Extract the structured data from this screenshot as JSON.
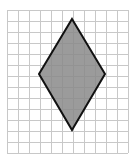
{
  "figure": {
    "grid": {
      "origin_x": 7,
      "origin_y": 10,
      "cell_size": 11,
      "columns": 11,
      "rows": 13,
      "line_color": "#c8c8c8",
      "background": "#ffffff"
    },
    "shape": {
      "type": "rhombus",
      "vertices": [
        [
          72,
          19
        ],
        [
          105,
          74
        ],
        [
          72,
          130
        ],
        [
          39,
          74
        ]
      ],
      "fill": "#8a8a8a",
      "stroke": "#111111",
      "stroke_width": 2
    }
  }
}
